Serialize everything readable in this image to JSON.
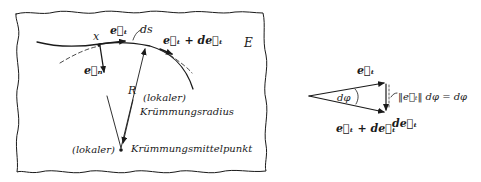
{
  "left_figure": {
    "frame_label": "E",
    "point_label": "x",
    "tangent_vector": "e⃗ₜ",
    "normal_vector": "e⃗ₙ",
    "arc_element": "ds",
    "tangent_plus_d": "e⃗ₜ + de⃗ₜ",
    "radius_label": "R",
    "radius_desc_line1": "(lokaler)",
    "radius_desc_line2": "Krümmungsradius",
    "center_prefix": "(lokaler)",
    "center_label": "Krümmungsmittelpunkt"
  },
  "right_figure": {
    "upper_vector": "e⃗ₜ",
    "lower_vector": "e⃗ₜ + de⃗ₜ",
    "angle_label": "dφ",
    "difference_vector": "de⃗ₜ",
    "magnitude_formula": "‖e⃗ₜ‖ dφ = dφ"
  },
  "colors": {
    "ink": "#1a1a1a",
    "background": "#ffffff"
  }
}
